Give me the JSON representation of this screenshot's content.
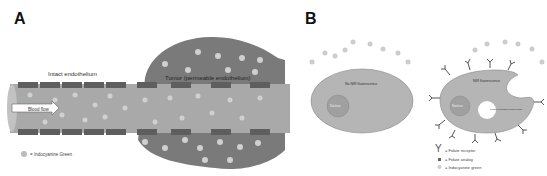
{
  "panels": {
    "a": {
      "label": "A",
      "intact_label": "Intact endothelium",
      "tumor_label": "Tumor (permeable endothelium)",
      "flow_label": "Blood flow",
      "legend": "= Indocyanine Green"
    },
    "b": {
      "label": "B",
      "left_cell_label": "No NIR fluorescence",
      "right_cell_label": "NIR fluorescence",
      "nucleus_label": "Nucleus",
      "vesicle_label": "Folate-mediated endocytosis",
      "legend": [
        "= Folate receptor",
        "= Folate analog",
        "= Indocyanine green"
      ]
    }
  },
  "colors": {
    "tumor": "#7a7a7a",
    "vessel": "#a9a9a9",
    "endothelium": "#5e5e5e",
    "cell": "#b5b5b5",
    "dye": "#cfcfcf"
  }
}
